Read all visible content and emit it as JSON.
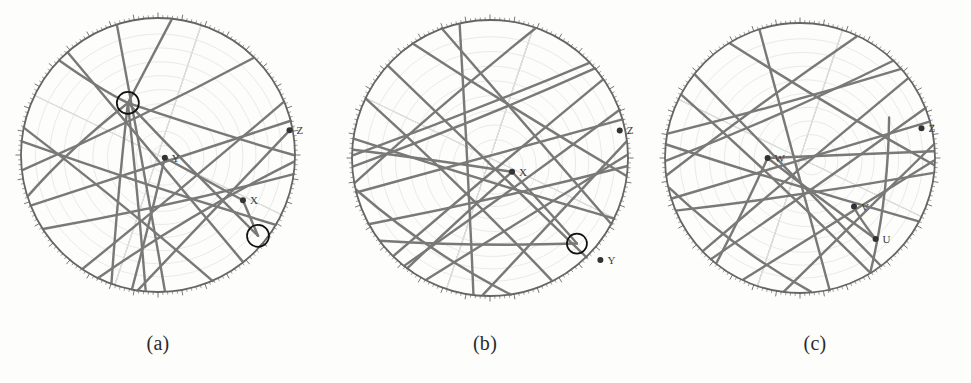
{
  "figure": {
    "background_color": "#fdfdfc",
    "line_color": "#6e6e6e",
    "net_color": "#c9c9c9",
    "rim_color": "#555555",
    "marker_color": "#333333",
    "highlight_color": "#111111",
    "width": 971,
    "height": 383
  },
  "captions": {
    "a": "(a)",
    "b": "(b)",
    "c": "(c)"
  },
  "panels": [
    {
      "id": "a",
      "caption": "(a)",
      "center": {
        "x": 158,
        "y": 155
      },
      "radius": 137,
      "axis_labels": [
        {
          "name": "Z",
          "text": "Z",
          "x": 0.96,
          "y": -0.18,
          "dot": true
        },
        {
          "name": "Y",
          "text": "Y",
          "x": 0.05,
          "y": 0.02,
          "dot": true
        },
        {
          "name": "X",
          "text": "X",
          "x": 0.62,
          "y": 0.33,
          "dot": true
        }
      ],
      "highlight_circles": [
        {
          "x": -0.22,
          "y": -0.38,
          "r": 11
        },
        {
          "x": 0.73,
          "y": 0.59,
          "r": 11
        }
      ],
      "great_circles": [
        {
          "x1": -0.995,
          "y1": -0.1,
          "x2": 0.86,
          "y2": 0.51
        },
        {
          "x1": -0.93,
          "y1": 0.37,
          "x2": 0.97,
          "y2": -0.25
        },
        {
          "x1": -0.66,
          "y1": -0.75,
          "x2": 0.62,
          "y2": 0.78
        },
        {
          "x1": -0.3,
          "y1": -0.95,
          "x2": 0.05,
          "y2": 0.99
        },
        {
          "x1": -0.99,
          "y1": 0.11,
          "x2": 0.7,
          "y2": -0.71
        },
        {
          "x1": -0.84,
          "y1": 0.54,
          "x2": 0.99,
          "y2": 0.14
        },
        {
          "x1": -0.55,
          "y1": 0.83,
          "x2": 0.92,
          "y2": -0.39
        },
        {
          "x1": -0.15,
          "y1": 0.99,
          "x2": 0.98,
          "y2": -0.2
        },
        {
          "x1": -0.22,
          "y1": -0.38,
          "x2": 0.99,
          "y2": 0.0
        },
        {
          "x1": -0.22,
          "y1": -0.38,
          "x2": 0.73,
          "y2": 0.59
        },
        {
          "x1": -0.22,
          "y1": -0.38,
          "x2": -0.95,
          "y2": 0.3
        },
        {
          "x1": -0.22,
          "y1": -0.38,
          "x2": -0.34,
          "y2": 0.94
        },
        {
          "x1": -0.22,
          "y1": -0.38,
          "x2": 0.1,
          "y2": -0.99
        },
        {
          "x1": -0.22,
          "y1": -0.38,
          "x2": -0.09,
          "y2": 0.99
        },
        {
          "x1": -0.22,
          "y1": -0.38,
          "x2": -0.72,
          "y2": -0.69
        },
        {
          "x1": 0.05,
          "y1": 0.02,
          "x2": -0.19,
          "y2": 0.98
        },
        {
          "x1": 0.05,
          "y1": 0.02,
          "x2": 0.62,
          "y2": 0.33
        },
        {
          "x1": 0.62,
          "y1": 0.33,
          "x2": 0.73,
          "y2": 0.59
        },
        {
          "x1": -0.98,
          "y1": -0.2,
          "x2": 0.4,
          "y2": 0.92
        },
        {
          "x1": -0.44,
          "y1": 0.9,
          "x2": 0.99,
          "y2": 0.05
        }
      ]
    },
    {
      "id": "b",
      "caption": "(b)",
      "center": {
        "x": 490,
        "y": 158
      },
      "radius": 138,
      "axis_labels": [
        {
          "name": "Z",
          "text": "Z",
          "x": 0.94,
          "y": -0.2,
          "dot": true
        },
        {
          "name": "X",
          "text": "X",
          "x": 0.16,
          "y": 0.1,
          "dot": true
        },
        {
          "name": "Y",
          "text": "Y",
          "x": 0.8,
          "y": 0.74,
          "dot": true
        }
      ],
      "highlight_circles": [
        {
          "x": 0.63,
          "y": 0.62,
          "r": 10
        }
      ],
      "great_circles": [
        {
          "x1": -0.99,
          "y1": -0.14,
          "x2": 0.9,
          "y2": 0.44
        },
        {
          "x1": -0.97,
          "y1": 0.25,
          "x2": 0.96,
          "y2": -0.28
        },
        {
          "x1": -0.74,
          "y1": -0.67,
          "x2": 0.7,
          "y2": 0.72
        },
        {
          "x1": -0.22,
          "y1": -0.97,
          "x2": -0.12,
          "y2": 0.99
        },
        {
          "x1": -0.99,
          "y1": 0.06,
          "x2": 0.76,
          "y2": -0.65
        },
        {
          "x1": -0.88,
          "y1": 0.48,
          "x2": 0.99,
          "y2": 0.06
        },
        {
          "x1": -0.62,
          "y1": 0.78,
          "x2": 0.94,
          "y2": -0.35
        },
        {
          "x1": -0.05,
          "y1": 0.99,
          "x2": 0.99,
          "y2": -0.12
        },
        {
          "x1": -0.56,
          "y1": -0.83,
          "x2": 0.99,
          "y2": 0.13
        },
        {
          "x1": -0.9,
          "y1": -0.43,
          "x2": 0.45,
          "y2": 0.89
        },
        {
          "x1": -0.97,
          "y1": 0.23,
          "x2": 0.15,
          "y2": 0.99
        },
        {
          "x1": -0.8,
          "y1": 0.6,
          "x2": 0.63,
          "y2": 0.62
        },
        {
          "x1": -0.35,
          "y1": -0.94,
          "x2": 0.88,
          "y2": 0.48
        },
        {
          "x1": 0.16,
          "y1": 0.1,
          "x2": -0.6,
          "y2": 0.8
        },
        {
          "x1": 0.16,
          "y1": 0.1,
          "x2": -0.99,
          "y2": -0.06
        },
        {
          "x1": 0.16,
          "y1": 0.1,
          "x2": 0.63,
          "y2": 0.62
        },
        {
          "x1": -0.98,
          "y1": 0.18,
          "x2": 0.33,
          "y2": -0.94
        },
        {
          "x1": -0.46,
          "y1": 0.88,
          "x2": 0.99,
          "y2": -0.02
        },
        {
          "x1": -0.99,
          "y1": -0.02,
          "x2": 0.72,
          "y2": -0.69
        },
        {
          "x1": -0.7,
          "y1": 0.71,
          "x2": 0.82,
          "y2": -0.57
        }
      ]
    },
    {
      "id": "c",
      "caption": "(c)",
      "center": {
        "x": 800,
        "y": 158
      },
      "radius": 135,
      "axis_labels": [
        {
          "name": "Z",
          "text": "Z",
          "x": 0.9,
          "y": -0.22,
          "dot": true
        },
        {
          "name": "W",
          "text": "W",
          "x": -0.24,
          "y": 0.0,
          "dot": true
        },
        {
          "name": "V",
          "text": "V",
          "x": 0.4,
          "y": 0.36,
          "dot": true
        },
        {
          "name": "U",
          "text": "U",
          "x": 0.56,
          "y": 0.6,
          "dot": true
        }
      ],
      "highlight_circles": [],
      "great_circles": [
        {
          "x1": -0.99,
          "y1": -0.1,
          "x2": 0.88,
          "y2": 0.47
        },
        {
          "x1": -0.95,
          "y1": 0.3,
          "x2": 0.96,
          "y2": -0.27
        },
        {
          "x1": -0.78,
          "y1": -0.62,
          "x2": 0.6,
          "y2": 0.8
        },
        {
          "x1": -0.3,
          "y1": -0.95,
          "x2": 0.22,
          "y2": 0.98
        },
        {
          "x1": -0.99,
          "y1": 0.02,
          "x2": 0.69,
          "y2": -0.72
        },
        {
          "x1": -0.92,
          "y1": 0.39,
          "x2": 0.99,
          "y2": 0.11
        },
        {
          "x1": -0.66,
          "y1": 0.75,
          "x2": 0.93,
          "y2": -0.37
        },
        {
          "x1": -0.12,
          "y1": 0.99,
          "x2": 0.99,
          "y2": -0.1
        },
        {
          "x1": -0.52,
          "y1": -0.85,
          "x2": 0.99,
          "y2": 0.05
        },
        {
          "x1": -0.88,
          "y1": -0.47,
          "x2": 0.52,
          "y2": 0.85
        },
        {
          "x1": -0.97,
          "y1": 0.22,
          "x2": 0.08,
          "y2": 0.99
        },
        {
          "x1": -0.24,
          "y1": 0.0,
          "x2": 0.56,
          "y2": 0.6
        },
        {
          "x1": -0.24,
          "y1": 0.0,
          "x2": 0.99,
          "y2": -0.05
        },
        {
          "x1": -0.24,
          "y1": 0.0,
          "x2": -0.62,
          "y2": 0.78
        },
        {
          "x1": 0.4,
          "y1": 0.36,
          "x2": 0.56,
          "y2": 0.6
        },
        {
          "x1": 0.66,
          "y1": -0.3,
          "x2": 0.52,
          "y2": 0.85
        },
        {
          "x1": -0.99,
          "y1": 0.13,
          "x2": 0.42,
          "y2": -0.9
        },
        {
          "x1": -0.42,
          "y1": 0.9,
          "x2": 0.99,
          "y2": 0.02
        },
        {
          "x1": -0.98,
          "y1": -0.18,
          "x2": 0.75,
          "y2": -0.66
        },
        {
          "x1": -0.72,
          "y1": 0.69,
          "x2": 0.8,
          "y2": -0.59
        }
      ]
    }
  ]
}
